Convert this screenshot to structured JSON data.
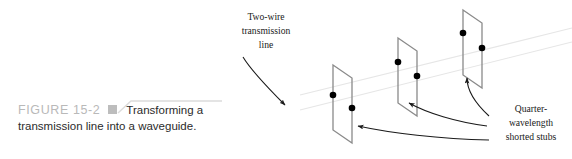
{
  "figure": {
    "label": "FIGURE 15-2",
    "caption_line1": "Transforming a",
    "caption_line2": "transmission line into a waveguide.",
    "label_color": "#b9b9b9",
    "square_color": "#bdbdbd",
    "rule_color": "#dcdcdc"
  },
  "diagram": {
    "stroke_color": "#8a8a8a",
    "dot_color": "#000000",
    "guide_color": "#e4e4e4",
    "arrow_color": "#1a1a1a",
    "labels": {
      "two_wire": [
        "Two-wire",
        "transmission",
        "line"
      ],
      "stubs": [
        "Quarter-",
        "wavelength",
        "shorted stubs"
      ]
    },
    "stubs": [
      {
        "name": "stub-near",
        "left_x": 333,
        "left_top": 65,
        "left_bottom": 130,
        "right_x": 352,
        "right_top": 78,
        "right_bottom": 143,
        "dot1": [
          333,
          95
        ],
        "dot2": [
          352,
          108
        ]
      },
      {
        "name": "stub-middle",
        "left_x": 398,
        "left_top": 38,
        "left_bottom": 103,
        "right_x": 417,
        "right_top": 51,
        "right_bottom": 116,
        "dot1": [
          398,
          62
        ],
        "dot2": [
          417,
          76
        ]
      },
      {
        "name": "stub-far",
        "left_x": 463,
        "left_top": 10,
        "left_bottom": 75,
        "right_x": 482,
        "right_top": 23,
        "right_bottom": 88,
        "dot1": [
          463,
          33
        ],
        "dot2": [
          482,
          48
        ]
      }
    ],
    "guide_lines": [
      {
        "name": "upper-rail",
        "x1": 300,
        "y1": 95,
        "x2": 572,
        "y2": 28
      },
      {
        "name": "lower-rail",
        "x1": 300,
        "y1": 110,
        "x2": 572,
        "y2": 42
      }
    ]
  }
}
